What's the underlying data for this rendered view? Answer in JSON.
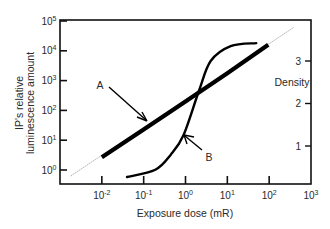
{
  "chart_data": {
    "type": "line",
    "title": "",
    "xlabel": "Exposure dose (mR)",
    "ylabel_left": [
      "IP's relative",
      "luminescence amount"
    ],
    "ylabel_right": "Density",
    "x_scale": "log",
    "y_scale_left": "log",
    "xlim": [
      0.001,
      1000
    ],
    "ylim_left": [
      0.3,
      100000
    ],
    "ylim_right": [
      0,
      3.8
    ],
    "grid": false,
    "x_ticks": [
      {
        "value": 0.01,
        "base": "10",
        "exp": "-2"
      },
      {
        "value": 0.1,
        "base": "10",
        "exp": "-1"
      },
      {
        "value": 1,
        "base": "10",
        "exp": "0"
      },
      {
        "value": 10,
        "base": "10",
        "exp": "1"
      },
      {
        "value": 100,
        "base": "10",
        "exp": "2"
      },
      {
        "value": 1000,
        "base": "10",
        "exp": "3"
      }
    ],
    "y_ticks_left": [
      {
        "value": 1,
        "base": "10",
        "exp": "0"
      },
      {
        "value": 10,
        "base": "10",
        "exp": "1"
      },
      {
        "value": 100,
        "base": "10",
        "exp": "2"
      },
      {
        "value": 1000,
        "base": "10",
        "exp": "3"
      },
      {
        "value": 10000,
        "base": "10",
        "exp": "4"
      },
      {
        "value": 100000,
        "base": "10",
        "exp": "5"
      }
    ],
    "y_ticks_right": [
      {
        "value": 1,
        "label": "1"
      },
      {
        "value": 2,
        "label": "2"
      },
      {
        "value": 3,
        "label": "3"
      }
    ],
    "series": [
      {
        "name": "A",
        "description": "IP relative luminescence (left axis, log)",
        "axis": "left",
        "style": "thick",
        "x": [
          0.01,
          0.1,
          1,
          10,
          95
        ],
        "y": [
          2.7,
          23,
          200,
          1750,
          16000
        ],
        "extension_dotted": {
          "x": [
            0.0018,
            400
          ],
          "y": [
            0.63,
            63000
          ]
        }
      },
      {
        "name": "B",
        "description": "Film density (right axis, linear)",
        "axis": "right",
        "style": "medium",
        "x": [
          0.04,
          0.19,
          0.44,
          0.9,
          2.1,
          4.0,
          12,
          49
        ],
        "y": [
          0.27,
          0.44,
          0.79,
          1.26,
          2.3,
          3.0,
          3.35,
          3.42
        ]
      }
    ],
    "annotations": [
      {
        "label": "A",
        "points_to": "series A"
      },
      {
        "label": "B",
        "points_to": "series B"
      }
    ],
    "legend": "none (arrow annotations A and B)"
  }
}
